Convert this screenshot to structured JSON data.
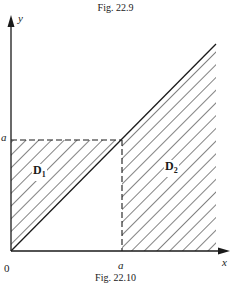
{
  "captions": {
    "top": "Fig. 22.9",
    "bottom": "Fig. 22.10"
  },
  "axes": {
    "x_label": "x",
    "y_label": "y",
    "origin_label": "0",
    "x_tick_label": "a",
    "y_tick_label": "a"
  },
  "regions": {
    "d1": {
      "main": "D",
      "sub": "1"
    },
    "d2": {
      "main": "D",
      "sub": "2"
    }
  },
  "colors": {
    "ink": "#1a1a1a",
    "background": "#ffffff"
  }
}
